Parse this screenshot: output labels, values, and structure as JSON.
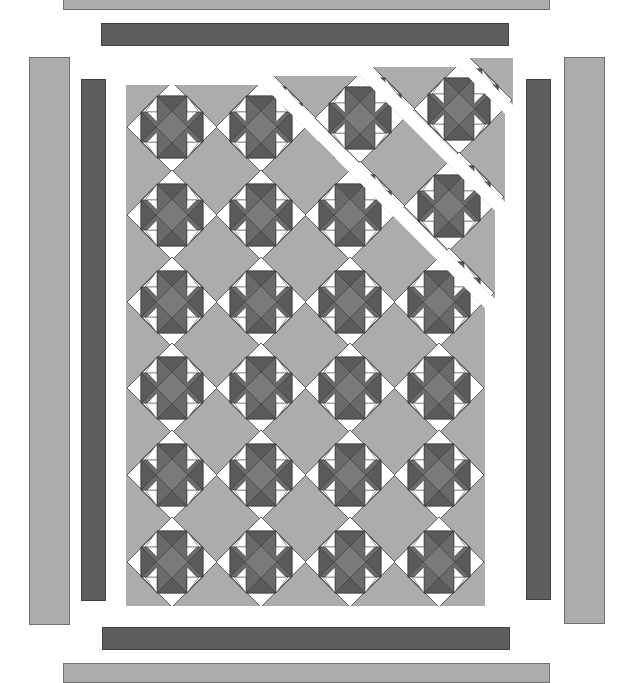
{
  "diagram": {
    "colors": {
      "background_fabric": "#acacac",
      "dark_fabric": "#5e5e5e",
      "light_fabric": "#ffffff",
      "block_mid": "#7a7a7a",
      "outline": "#3c3c3c"
    },
    "center": {
      "layout": "on-point blocks with setting squares",
      "block_columns": 4,
      "block_rows": 6,
      "block_size_px": 90,
      "col_centers_x": [
        172,
        261,
        350,
        439
      ],
      "row_centers_y": [
        127,
        215,
        302,
        388,
        475,
        562
      ],
      "panel": {
        "x": 126,
        "y": 85,
        "right": 485,
        "bottom": 606
      },
      "diagonal_sections": [
        {
          "name": "main",
          "offset": [
            0,
            0
          ]
        },
        {
          "name": "strip-1",
          "offset": [
            10,
            -9
          ]
        },
        {
          "name": "strip-2",
          "offset": [
            20,
            -18
          ]
        },
        {
          "name": "corner",
          "offset": [
            30,
            -27
          ]
        }
      ]
    },
    "borders": {
      "inner_top": {
        "fabric": "dark",
        "x": 101,
        "y": 23,
        "w": 408,
        "h": 23
      },
      "inner_bottom": {
        "fabric": "dark",
        "x": 102,
        "y": 627,
        "w": 408,
        "h": 23
      },
      "inner_left": {
        "fabric": "dark",
        "x": 81,
        "y": 79,
        "w": 25,
        "h": 522
      },
      "inner_right": {
        "fabric": "dark",
        "x": 526,
        "y": 79,
        "w": 25,
        "h": 521
      },
      "outer_top": {
        "fabric": "light",
        "x": 63,
        "y": -4,
        "w": 487,
        "h": 14
      },
      "outer_bottom": {
        "fabric": "light",
        "x": 63,
        "y": 663,
        "w": 487,
        "h": 20
      },
      "outer_left": {
        "fabric": "light",
        "x": 29,
        "y": 57,
        "w": 41,
        "h": 568
      },
      "outer_right": {
        "fabric": "light",
        "x": 564,
        "y": 57,
        "w": 41,
        "h": 567
      }
    }
  }
}
